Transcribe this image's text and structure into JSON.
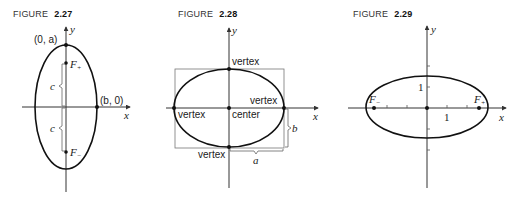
{
  "figures": [
    {
      "caption_word": "FIGURE",
      "caption_number": "2.27",
      "axis_x_label": "x",
      "axis_y_label": "y",
      "top_vertex_label": "(0, a)",
      "right_vertex_label": "(b, 0)",
      "focus_upper_label": "F",
      "focus_upper_sub": "+",
      "focus_lower_label": "F",
      "focus_lower_sub": "−",
      "bracket_upper_label": "c",
      "bracket_lower_label": "c"
    },
    {
      "caption_word": "FIGURE",
      "caption_number": "2.28",
      "axis_x_label": "x",
      "axis_y_label": "y",
      "vertex_top_label": "vertex",
      "vertex_right_label": "vertex",
      "vertex_left_label": "vertex",
      "vertex_bottom_label": "vertex",
      "center_label": "center",
      "brace_vertical_label": "b",
      "brace_horizontal_label": "a"
    },
    {
      "caption_word": "FIGURE",
      "caption_number": "2.29",
      "axis_x_label": "x",
      "axis_y_label": "y",
      "tick_x_label": "1",
      "tick_y_label": "1",
      "focus_left_label": "F",
      "focus_left_sub": "−",
      "focus_right_label": "F",
      "focus_right_sub": "+"
    }
  ]
}
